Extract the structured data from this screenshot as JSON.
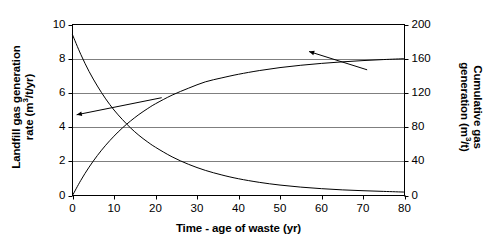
{
  "chart_data": {
    "type": "line",
    "title": "",
    "subtitle": "",
    "xlabel": "Time - age of waste (yr)",
    "ylabel": "Landfill gas generation\nrate (m3/t/yr)",
    "ylabel_secondary": "Cumulative gas\ngeneration (m3/t)",
    "xlim": [
      0,
      80
    ],
    "ylim": [
      0,
      10
    ],
    "ylim_secondary": [
      0,
      200
    ],
    "grid": true,
    "grid_axis": "y",
    "legend": "none",
    "annotations": [
      {
        "name": "left-arrow-to-cumulative-curve",
        "points_to": "cumulative gas generation curve",
        "from_x": 1.0,
        "from_y": 4.72,
        "to_x": 21.5,
        "to_y": 5.72,
        "axis": "primary"
      },
      {
        "name": "right-arrow-to-rate-curve",
        "points_to": "landfill gas generation rate axis",
        "from_x": 57.0,
        "from_y": 8.42,
        "to_x": 71.0,
        "to_y": 7.35,
        "axis": "primary"
      }
    ],
    "xticks": [
      0,
      10,
      20,
      30,
      40,
      50,
      60,
      70,
      80
    ],
    "xtick_labels": [
      "0",
      "10",
      "20",
      "30",
      "40",
      "50",
      "60",
      "70",
      "80"
    ],
    "yticks": [
      0,
      2,
      4,
      6,
      8,
      10
    ],
    "ytick_labels": [
      "0",
      "2",
      "4",
      "6",
      "8",
      "10"
    ],
    "yticks_secondary": [
      0,
      40,
      80,
      120,
      160,
      200
    ],
    "ytick_labels_secondary": [
      "0",
      "40",
      "80",
      "120",
      "160",
      "200"
    ],
    "series": [
      {
        "name": "Landfill gas generation rate",
        "axis": "primary",
        "units": "m3/t/yr",
        "color": "#000000",
        "x": [
          0,
          2,
          4,
          6,
          8,
          10,
          12,
          14,
          16,
          18,
          20,
          24,
          28,
          32,
          36,
          40,
          45,
          50,
          55,
          60,
          65,
          70,
          75,
          80
        ],
        "y": [
          9.4,
          8.25,
          7.25,
          6.4,
          5.65,
          5.0,
          4.45,
          3.95,
          3.52,
          3.15,
          2.82,
          2.26,
          1.82,
          1.47,
          1.2,
          0.98,
          0.77,
          0.61,
          0.49,
          0.4,
          0.33,
          0.28,
          0.24,
          0.2
        ]
      },
      {
        "name": "Cumulative gas generation",
        "axis": "secondary",
        "units": "m3/t",
        "color": "#000000",
        "x": [
          0,
          2,
          4,
          6,
          8,
          10,
          12,
          14,
          16,
          18,
          20,
          24,
          28,
          32,
          36,
          40,
          45,
          50,
          55,
          60,
          65,
          70,
          75,
          80
        ],
        "y": [
          0,
          17.7,
          33.2,
          46.8,
          58.8,
          69.4,
          78.9,
          87.2,
          94.7,
          101.3,
          107.3,
          117.4,
          125.6,
          132.9,
          137.6,
          141.8,
          146.1,
          149.6,
          152.3,
          154.5,
          156.3,
          157.8,
          159.0,
          160.0
        ]
      }
    ]
  }
}
